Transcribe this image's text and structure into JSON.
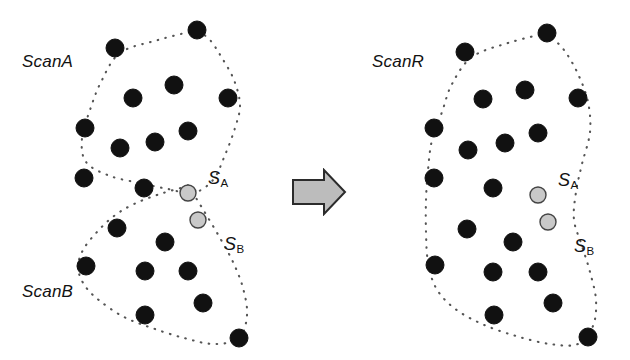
{
  "figure": {
    "background": "#ffffff",
    "width": 630,
    "height": 360
  },
  "colors": {
    "dot_fill": "#111111",
    "dot_stroke": "#111111",
    "special_dot_fill": "#c9c9c9",
    "special_dot_stroke": "#444444",
    "boundary": "#555555",
    "arrow_fill": "#bcbcbc",
    "arrow_stroke": "#2b2b2b",
    "text": "#121212"
  },
  "left_panel": {
    "name": "left-scan-panel",
    "labels": {
      "scan_a": "ScanA",
      "scan_b": "ScanB",
      "s_a_letter": "S",
      "s_a_sub": "A",
      "s_b_letter": "S",
      "s_b_sub": "B"
    },
    "label_positions": {
      "scan_a": {
        "x": 22,
        "y": 52
      },
      "scan_b": {
        "x": 22,
        "y": 282
      },
      "s_a": {
        "x": 208,
        "y": 168
      },
      "s_b": {
        "x": 224,
        "y": 234
      }
    },
    "dot_radius": 9,
    "special_dot_radius": 8,
    "dots": [
      {
        "x": 197,
        "y": 30
      },
      {
        "x": 115,
        "y": 48
      },
      {
        "x": 174,
        "y": 85
      },
      {
        "x": 133,
        "y": 98
      },
      {
        "x": 228,
        "y": 98
      },
      {
        "x": 85,
        "y": 128
      },
      {
        "x": 188,
        "y": 131
      },
      {
        "x": 155,
        "y": 142
      },
      {
        "x": 120,
        "y": 148
      },
      {
        "x": 84,
        "y": 178
      },
      {
        "x": 144,
        "y": 188
      },
      {
        "x": 117,
        "y": 228
      },
      {
        "x": 165,
        "y": 242
      },
      {
        "x": 86,
        "y": 266
      },
      {
        "x": 145,
        "y": 271
      },
      {
        "x": 188,
        "y": 271
      },
      {
        "x": 203,
        "y": 303
      },
      {
        "x": 145,
        "y": 315
      },
      {
        "x": 239,
        "y": 338
      }
    ],
    "special_dots": [
      {
        "id": "S_A",
        "x": 188,
        "y": 193
      },
      {
        "id": "S_B",
        "x": 198,
        "y": 220
      }
    ],
    "boundaries": [
      {
        "id": "ScanA",
        "points": [
          [
            197,
            30
          ],
          [
            158,
            40
          ],
          [
            120,
            53
          ],
          [
            101,
            82
          ],
          [
            90,
            110
          ],
          [
            82,
            138
          ],
          [
            86,
            162
          ],
          [
            110,
            176
          ],
          [
            140,
            183
          ],
          [
            168,
            189
          ],
          [
            193,
            193
          ],
          [
            213,
            180
          ],
          [
            225,
            155
          ],
          [
            235,
            128
          ],
          [
            240,
            105
          ],
          [
            234,
            80
          ],
          [
            222,
            58
          ],
          [
            210,
            40
          ],
          [
            197,
            30
          ]
        ]
      },
      {
        "id": "ScanB",
        "points": [
          [
            188,
            186
          ],
          [
            160,
            194
          ],
          [
            134,
            204
          ],
          [
            114,
            216
          ],
          [
            97,
            232
          ],
          [
            83,
            250
          ],
          [
            78,
            268
          ],
          [
            85,
            286
          ],
          [
            100,
            301
          ],
          [
            124,
            317
          ],
          [
            152,
            328
          ],
          [
            184,
            338
          ],
          [
            214,
            344
          ],
          [
            239,
            338
          ],
          [
            247,
            315
          ],
          [
            243,
            288
          ],
          [
            233,
            262
          ],
          [
            220,
            238
          ],
          [
            207,
            216
          ],
          [
            196,
            198
          ],
          [
            188,
            186
          ]
        ]
      }
    ]
  },
  "right_panel": {
    "name": "right-merged-scan-panel",
    "labels": {
      "scan_r": "ScanR",
      "s_a_letter": "S",
      "s_a_sub": "A",
      "s_b_letter": "S",
      "s_b_sub": "B"
    },
    "label_positions": {
      "scan_r": {
        "x": 22,
        "y": 52
      },
      "s_a": {
        "x": 208,
        "y": 170
      },
      "s_b": {
        "x": 224,
        "y": 236
      }
    },
    "dot_radius": 9,
    "special_dot_radius": 8,
    "dots": [
      {
        "x": 197,
        "y": 33
      },
      {
        "x": 115,
        "y": 52
      },
      {
        "x": 175,
        "y": 90
      },
      {
        "x": 133,
        "y": 99
      },
      {
        "x": 228,
        "y": 98
      },
      {
        "x": 84,
        "y": 128
      },
      {
        "x": 188,
        "y": 133
      },
      {
        "x": 155,
        "y": 143
      },
      {
        "x": 118,
        "y": 150
      },
      {
        "x": 84,
        "y": 178
      },
      {
        "x": 143,
        "y": 188
      },
      {
        "x": 117,
        "y": 229
      },
      {
        "x": 163,
        "y": 242
      },
      {
        "x": 85,
        "y": 265
      },
      {
        "x": 143,
        "y": 272
      },
      {
        "x": 188,
        "y": 272
      },
      {
        "x": 203,
        "y": 303
      },
      {
        "x": 144,
        "y": 315
      },
      {
        "x": 238,
        "y": 337
      }
    ],
    "special_dots": [
      {
        "id": "S_A",
        "x": 188,
        "y": 195
      },
      {
        "id": "S_B",
        "x": 198,
        "y": 222
      }
    ],
    "boundaries": [
      {
        "id": "ScanR",
        "points": [
          [
            197,
            33
          ],
          [
            158,
            43
          ],
          [
            122,
            57
          ],
          [
            102,
            84
          ],
          [
            92,
            112
          ],
          [
            82,
            140
          ],
          [
            78,
            170
          ],
          [
            76,
            200
          ],
          [
            76,
            232
          ],
          [
            78,
            262
          ],
          [
            86,
            288
          ],
          [
            104,
            308
          ],
          [
            132,
            324
          ],
          [
            166,
            336
          ],
          [
            200,
            344
          ],
          [
            228,
            344
          ],
          [
            243,
            326
          ],
          [
            246,
            300
          ],
          [
            240,
            272
          ],
          [
            232,
            246
          ],
          [
            224,
            220
          ],
          [
            226,
            192
          ],
          [
            232,
            164
          ],
          [
            240,
            132
          ],
          [
            238,
            102
          ],
          [
            228,
            74
          ],
          [
            214,
            50
          ],
          [
            197,
            33
          ]
        ]
      }
    ]
  },
  "arrow": {
    "name": "transform-arrow",
    "direction": "right",
    "x": 291,
    "y": 168,
    "width": 56,
    "height": 48
  }
}
